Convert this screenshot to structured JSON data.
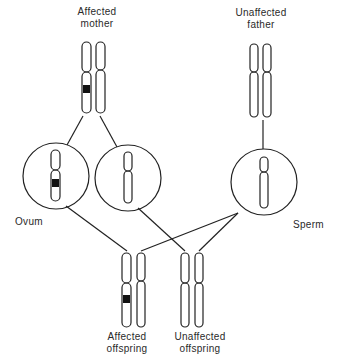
{
  "labels": {
    "mother": {
      "line1": "Affected",
      "line2": "mother"
    },
    "father": {
      "line1": "Unaffected",
      "line2": "father"
    },
    "ovum": "Ovum",
    "sperm": "Sperm",
    "affected_offspring": {
      "line1": "Affected",
      "line2": "offspring"
    },
    "unaffected_offspring": {
      "line1": "Unaffected",
      "line2": "offspring"
    }
  },
  "colors": {
    "line": "#222222",
    "band": "#111111",
    "background": "#ffffff"
  }
}
